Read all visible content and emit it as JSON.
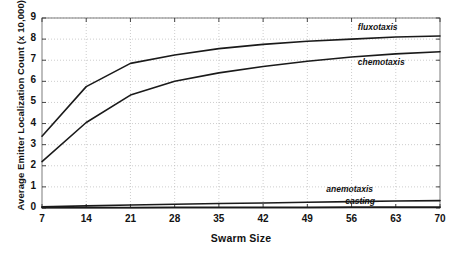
{
  "chart_data": {
    "type": "line",
    "title": "",
    "xlabel": "Swarm Size",
    "ylabel": "Average Emitter Localization Count (x 10,000)",
    "xlim": [
      7,
      70
    ],
    "ylim": [
      0,
      9
    ],
    "grid": true,
    "legend_position": "inline-right",
    "x": [
      7,
      14,
      21,
      28,
      35,
      42,
      49,
      56,
      63,
      70
    ],
    "xticks": [
      "7",
      "14",
      "21",
      "28",
      "35",
      "42",
      "49",
      "56",
      "63",
      "70"
    ],
    "yticks": [
      "0",
      "1",
      "2",
      "3",
      "4",
      "5",
      "6",
      "7",
      "8",
      "9"
    ],
    "series": [
      {
        "name": "fluxotaxis",
        "values": [
          3.4,
          5.75,
          6.85,
          7.25,
          7.55,
          7.75,
          7.9,
          8.0,
          8.1,
          8.15
        ]
      },
      {
        "name": "chemotaxis",
        "values": [
          2.2,
          4.05,
          5.35,
          6.0,
          6.4,
          6.7,
          6.95,
          7.15,
          7.3,
          7.4
        ]
      },
      {
        "name": "anemotaxis",
        "values": [
          0.06,
          0.1,
          0.14,
          0.18,
          0.21,
          0.24,
          0.27,
          0.3,
          0.33,
          0.35
        ]
      },
      {
        "name": "casting",
        "values": [
          0.02,
          0.02,
          0.02,
          0.03,
          0.03,
          0.03,
          0.03,
          0.04,
          0.04,
          0.04
        ]
      }
    ],
    "annotations": [
      {
        "text": "fluxotaxis",
        "x": 57,
        "y": 8.55
      },
      {
        "text": "chemotaxis",
        "x": 57,
        "y": 6.85
      },
      {
        "text": "anemotaxis",
        "x": 52,
        "y": 0.85
      },
      {
        "text": "casting",
        "x": 55,
        "y": 0.3
      }
    ],
    "colors": {
      "line": "#1a1a1a",
      "grid": "#b8b8b8",
      "axis": "#6e6e6e",
      "background": "#ffffff"
    }
  }
}
